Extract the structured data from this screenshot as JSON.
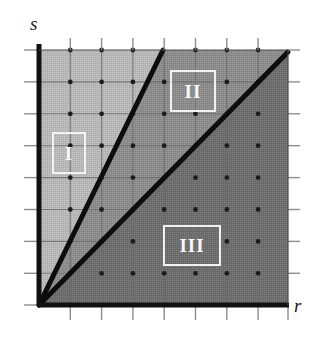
{
  "figure": {
    "type": "region-partition-diagram",
    "background_color": "#ffffff",
    "axes": {
      "x_label": "r",
      "y_label": "s",
      "axis_color": "#111111",
      "x_axis_y_px": 305,
      "y_axis_x_px": 39,
      "plot_left_px": 39,
      "plot_right_px": 288,
      "plot_top_px": 50,
      "plot_bottom_px": 305
    },
    "grid": {
      "visible": true,
      "columns": 8,
      "rows": 8,
      "spacing_px": 31.3,
      "line_color": "#6f6f6f",
      "lattice_dots": true,
      "lattice_dot_color": "#1c1c1c",
      "ticks_outside": true
    },
    "boundary_lines": [
      {
        "name": "steep-boundary-line",
        "from": [
          39,
          305
        ],
        "to": [
          163,
          50
        ],
        "color": "#0d0d0d",
        "width_px": 5
      },
      {
        "name": "shallow-boundary-line",
        "from": [
          39,
          305
        ],
        "to": [
          288,
          52
        ],
        "color": "#0d0d0d",
        "width_px": 5
      }
    ],
    "regions": [
      {
        "id": "I",
        "label": "I",
        "fill": "#b6b6b6",
        "description": "left wedge above steep boundary line"
      },
      {
        "id": "II",
        "label": "II",
        "fill": "#8c8c8c",
        "description": "middle wedge between steep and shallow boundary lines"
      },
      {
        "id": "III",
        "label": "III",
        "fill": "#6e6e6e",
        "description": "lower wedge below shallow boundary line"
      }
    ]
  }
}
